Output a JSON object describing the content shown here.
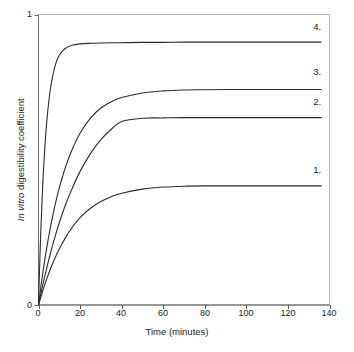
{
  "chart_data": {
    "type": "line",
    "title": "",
    "subtitle": "",
    "xlabel": "Time (minutes)",
    "ylabel": "In vitro digestibility coefficient",
    "ylabel_italic_prefix": "In vitro",
    "ylabel_plain_suffix": " digestibility coefficient",
    "xlim": [
      0,
      140
    ],
    "ylim": [
      0,
      1
    ],
    "xticks": [
      0,
      20,
      40,
      60,
      80,
      100,
      120,
      140
    ],
    "xtick_labels": [
      "0",
      "20",
      "40",
      "60",
      "80",
      "100",
      "120",
      "140"
    ],
    "yticks": [
      0,
      1
    ],
    "ytick_labels": [
      "0",
      "1"
    ],
    "grid": false,
    "legend_position": "inline-right-end",
    "line_color": "#2b2b2b",
    "frame_color": "#b3b3b3",
    "axis_color": "#4d4d4d",
    "series": [
      {
        "name": "1.",
        "label": "1.",
        "plateau": 0.41,
        "rate": 0.062,
        "x": [
          0,
          2,
          4,
          6,
          8,
          10,
          13,
          16,
          20,
          25,
          30,
          35,
          40,
          50,
          60,
          70,
          80,
          90,
          100,
          110,
          120,
          130,
          136
        ],
        "values": [
          0,
          0.048,
          0.091,
          0.129,
          0.163,
          0.193,
          0.232,
          0.265,
          0.301,
          0.333,
          0.356,
          0.373,
          0.385,
          0.399,
          0.406,
          0.409,
          0.41,
          0.41,
          0.41,
          0.41,
          0.41,
          0.41,
          0.41
        ],
        "label_x": 136,
        "label_y": 0.46
      },
      {
        "name": "2.",
        "label": "2.",
        "plateau": 0.645,
        "rate": 0.055,
        "x": [
          0,
          2,
          4,
          6,
          8,
          10,
          13,
          16,
          20,
          25,
          30,
          35,
          40,
          50,
          60,
          70,
          80,
          90,
          100,
          110,
          120,
          130,
          136
        ],
        "values": [
          0,
          0.067,
          0.129,
          0.185,
          0.236,
          0.283,
          0.345,
          0.398,
          0.46,
          0.521,
          0.569,
          0.605,
          0.632,
          0.643,
          0.644,
          0.645,
          0.645,
          0.645,
          0.645,
          0.645,
          0.645,
          0.645,
          0.645
        ],
        "label_x": 136,
        "label_y": 0.695
      },
      {
        "name": "3.",
        "label": "3.",
        "plateau": 0.742,
        "rate": 0.078,
        "x": [
          0,
          2,
          4,
          6,
          8,
          10,
          13,
          16,
          20,
          25,
          30,
          35,
          40,
          50,
          60,
          70,
          80,
          90,
          100,
          110,
          120,
          130,
          136
        ],
        "values": [
          0,
          0.107,
          0.199,
          0.277,
          0.345,
          0.403,
          0.475,
          0.532,
          0.591,
          0.643,
          0.678,
          0.7,
          0.714,
          0.73,
          0.737,
          0.74,
          0.741,
          0.742,
          0.742,
          0.742,
          0.742,
          0.742,
          0.742
        ],
        "label_x": 136,
        "label_y": 0.8
      },
      {
        "name": "4.",
        "label": "4.",
        "plateau": 0.905,
        "rate": 0.3,
        "x": [
          0,
          1,
          2,
          3,
          4,
          5,
          6,
          8,
          10,
          13,
          16,
          20,
          25,
          30,
          40,
          50,
          60,
          70,
          80,
          90,
          100,
          110,
          120,
          130,
          136
        ],
        "values": [
          0,
          0.235,
          0.408,
          0.537,
          0.633,
          0.703,
          0.756,
          0.824,
          0.86,
          0.884,
          0.894,
          0.899,
          0.901,
          0.902,
          0.903,
          0.904,
          0.904,
          0.905,
          0.905,
          0.905,
          0.905,
          0.905,
          0.905,
          0.905,
          0.905
        ],
        "label_x": 136,
        "label_y": 0.955
      }
    ]
  },
  "axes": {
    "x_title": "Time (minutes)",
    "y_title_italic": "In vitro",
    "y_title_rest": " digestibility coefficient",
    "x_tick_labels": [
      "0",
      "20",
      "40",
      "60",
      "80",
      "100",
      "120",
      "140"
    ],
    "y_tick_labels": [
      "1",
      "0"
    ]
  },
  "series_labels": {
    "s1": "1.",
    "s2": "2.",
    "s3": "3.",
    "s4": "4."
  }
}
